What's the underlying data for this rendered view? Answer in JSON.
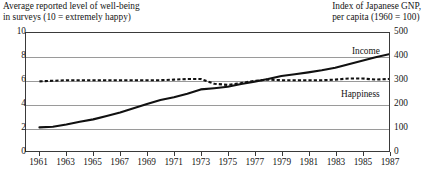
{
  "chart_data": {
    "type": "line",
    "title": "",
    "left_axis": {
      "title_lines": [
        "Average reported level of well-being",
        "in surveys (10 = extremely happy)"
      ],
      "ticks": [
        0,
        2,
        4,
        6,
        8,
        10
      ],
      "ylim": [
        0,
        10
      ]
    },
    "right_axis": {
      "title_lines": [
        "Index of Japanese GNP,",
        "per capita (1960 = 100)"
      ],
      "ticks": [
        0,
        100,
        200,
        300,
        400,
        500
      ],
      "ylim": [
        0,
        500
      ]
    },
    "xlabel": "",
    "xlim": [
      1960,
      1987
    ],
    "x_ticks": [
      1961,
      1963,
      1965,
      1967,
      1969,
      1971,
      1973,
      1975,
      1977,
      1979,
      1981,
      1983,
      1985,
      1987
    ],
    "grid": true,
    "legend_position": "inline-annotations",
    "series": [
      {
        "name": "Income",
        "label": "Income",
        "style": "solid",
        "axis": "right",
        "x": [
          1961,
          1962,
          1963,
          1964,
          1965,
          1966,
          1967,
          1968,
          1969,
          1970,
          1971,
          1972,
          1973,
          1974,
          1975,
          1976,
          1977,
          1978,
          1979,
          1980,
          1981,
          1982,
          1983,
          1984,
          1985,
          1986,
          1987
        ],
        "values": [
          100,
          103,
          112,
          124,
          134,
          148,
          163,
          181,
          199,
          216,
          228,
          243,
          261,
          266,
          272,
          284,
          294,
          305,
          318,
          325,
          333,
          342,
          353,
          368,
          382,
          397,
          410
        ]
      },
      {
        "name": "Happiness",
        "label": "Happiness",
        "style": "dashed",
        "axis": "left",
        "x": [
          1961,
          1962,
          1963,
          1964,
          1965,
          1966,
          1967,
          1968,
          1969,
          1970,
          1971,
          1972,
          1973,
          1974,
          1975,
          1976,
          1977,
          1978,
          1979,
          1980,
          1981,
          1982,
          1983,
          1984,
          1985,
          1986,
          1987
        ],
        "values": [
          5.9,
          5.95,
          6.0,
          6.0,
          6.0,
          6.0,
          6.0,
          6.0,
          6.0,
          6.0,
          6.05,
          6.1,
          6.1,
          5.7,
          5.6,
          5.75,
          5.95,
          6.05,
          6.0,
          6.0,
          6.0,
          6.0,
          6.05,
          6.15,
          6.15,
          6.05,
          6.1
        ]
      }
    ]
  },
  "colors": {
    "ink": "#151515",
    "frame": "#3a3a3a",
    "grid": "#9a9a9a",
    "series": "#111111",
    "background": "#ffffff"
  }
}
